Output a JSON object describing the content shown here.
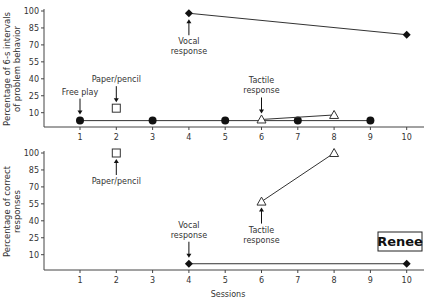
{
  "chart_data": [
    {
      "type": "line",
      "panel": "top",
      "title": "",
      "xlabel": "",
      "ylabel": "Percentage of 6-s intervals of problem behavior",
      "ylabel_lines": [
        "Percentage of 6-s intervals",
        "of problem behavior"
      ],
      "ylim": [
        0,
        100
      ],
      "yticks": [
        10,
        25,
        40,
        55,
        70,
        85,
        100
      ],
      "xlim": [
        0,
        10.5
      ],
      "xticks": [
        1,
        2,
        3,
        4,
        5,
        6,
        7,
        8,
        9,
        10
      ],
      "grid": false,
      "series": [
        {
          "name": "Free play",
          "marker": "filled-circle",
          "x": [
            1,
            3,
            5,
            7,
            9
          ],
          "y": [
            3,
            3,
            3,
            3,
            3
          ]
        },
        {
          "name": "Paper/pencil",
          "marker": "open-square",
          "x": [
            2
          ],
          "y": [
            14
          ]
        },
        {
          "name": "Vocal response",
          "marker": "filled-diamond",
          "x": [
            4,
            10
          ],
          "y": [
            98,
            79
          ]
        },
        {
          "name": "Tactile response",
          "marker": "open-triangle",
          "x": [
            6,
            8
          ],
          "y": [
            4,
            8
          ]
        }
      ],
      "annotations": [
        {
          "text": [
            "Free play"
          ],
          "x": 1,
          "arrow": "down"
        },
        {
          "text": [
            "Paper/pencil"
          ],
          "x": 2,
          "arrow": "down"
        },
        {
          "text": [
            "Vocal",
            "response"
          ],
          "x": 4,
          "arrow": "up"
        },
        {
          "text": [
            "Tactile",
            "response"
          ],
          "x": 6,
          "arrow": "down"
        }
      ]
    },
    {
      "type": "line",
      "panel": "bottom",
      "title": "",
      "xlabel": "Sessions",
      "ylabel": "Percentage of correct responses",
      "ylabel_lines": [
        "Percentage of correct",
        "responses"
      ],
      "ylim": [
        0,
        100
      ],
      "yticks": [
        10,
        25,
        40,
        55,
        70,
        85,
        100
      ],
      "xlim": [
        0,
        10.5
      ],
      "xticks": [
        1,
        2,
        3,
        4,
        5,
        6,
        7,
        8,
        9,
        10
      ],
      "grid": false,
      "series": [
        {
          "name": "Paper/pencil",
          "marker": "open-square",
          "x": [
            2
          ],
          "y": [
            100
          ]
        },
        {
          "name": "Vocal response",
          "marker": "filled-diamond",
          "x": [
            4,
            10
          ],
          "y": [
            2,
            2
          ]
        },
        {
          "name": "Tactile response",
          "marker": "open-triangle",
          "x": [
            6,
            8
          ],
          "y": [
            57,
            100
          ]
        }
      ],
      "annotations": [
        {
          "text": [
            "Paper/pencil"
          ],
          "x": 2,
          "arrow": "up"
        },
        {
          "text": [
            "Vocal",
            "response"
          ],
          "x": 4,
          "arrow": "down"
        },
        {
          "text": [
            "Tactile",
            "response"
          ],
          "x": 6,
          "arrow": "up"
        }
      ],
      "label_box": "Renee"
    }
  ],
  "participant": "Renee",
  "x_axis_title": "Sessions"
}
